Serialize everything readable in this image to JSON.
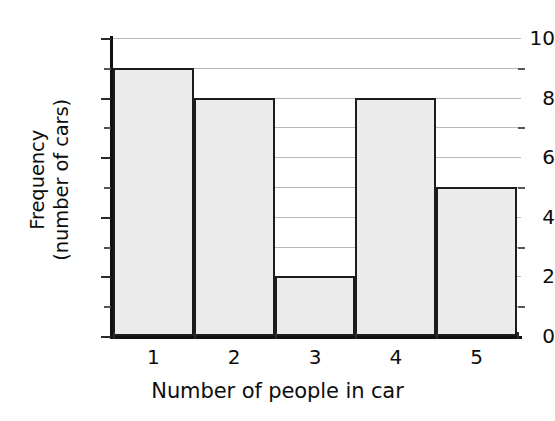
{
  "chart_data": {
    "type": "bar",
    "title": "",
    "subtitle": "",
    "xlabel": "Number of people in car",
    "ylabel": "Frequency (number of cars)",
    "ylabel_lines": [
      "Frequency",
      "(number of cars)"
    ],
    "categories": [
      "1",
      "2",
      "3",
      "4",
      "5"
    ],
    "values": [
      9,
      8,
      2,
      8,
      5
    ],
    "series": [
      {
        "name": "Frequency",
        "values": [
          9,
          8,
          2,
          8,
          5
        ]
      }
    ],
    "ylim": [
      0,
      10
    ],
    "xlim": [
      0.5,
      5.5
    ],
    "y_major_ticks": [
      0,
      2,
      4,
      6,
      8,
      10
    ],
    "y_major_tick_labels": [
      "0",
      "2",
      "4",
      "6",
      "8",
      "10"
    ],
    "y_minor_ticks": [
      1,
      3,
      5,
      7,
      9
    ],
    "gridlines": [
      1,
      2,
      3,
      4,
      5,
      6,
      7,
      8,
      9,
      10
    ],
    "grid": true,
    "grid_axis": "y",
    "legend": false,
    "legend_position": "none",
    "bar_gap": 0,
    "colors": {
      "bar_fill": "#ececec",
      "bar_edge": "#1c1c1c",
      "grid": "#b9b9b9",
      "axis": "#111111",
      "text": "#0d0d0d",
      "background": "#ffffff"
    }
  }
}
